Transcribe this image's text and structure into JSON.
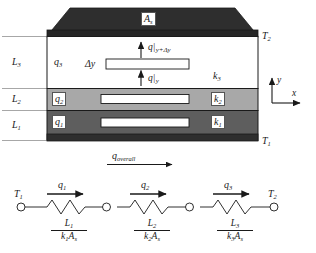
{
  "figure": {
    "colors": {
      "layer1": "#5e5e5e",
      "layer2": "#a8a8a8",
      "layer3": "#ffffff",
      "top_slab": "#2e2e2e",
      "bottom_strip": "#2e2e2e",
      "outline": "#1a1a1a",
      "dimension_line": "#808080"
    }
  },
  "slab": {
    "area_label": "A",
    "area_sub": "s",
    "top_temperature": "T",
    "top_temperature_sub": "2",
    "bottom_temperature": "T",
    "bottom_temperature_sub": "1"
  },
  "layers": [
    {
      "thickness_label": "L",
      "thickness_sub": "3",
      "heat_label": "q",
      "heat_sub": "3",
      "conductivity_label": "k",
      "conductivity_sub": "3",
      "fill": "#ffffff"
    },
    {
      "thickness_label": "L",
      "thickness_sub": "2",
      "heat_label": "q",
      "heat_sub": "2",
      "conductivity_label": "k",
      "conductivity_sub": "2",
      "fill": "#a8a8a8"
    },
    {
      "thickness_label": "L",
      "thickness_sub": "1",
      "heat_label": "q",
      "heat_sub": "1",
      "conductivity_label": "k",
      "conductivity_sub": "1",
      "fill": "#5e5e5e"
    }
  ],
  "control_volume": {
    "delta_y_label": "Δy",
    "flux_in_base": "q",
    "flux_in_sub": "y",
    "flux_out_base": "q",
    "flux_out_sub": "y+Δy"
  },
  "overall": {
    "label": "q",
    "subscript": "overall"
  },
  "axes": {
    "x_label": "x",
    "y_label": "y"
  },
  "network": {
    "left_node_label": "T",
    "left_node_sub": "1",
    "right_node_label": "T",
    "right_node_sub": "2",
    "resistors": [
      {
        "flow_label": "q",
        "flow_sub": "1",
        "numerator": "L",
        "numerator_sub": "1",
        "denominator_k": "k",
        "denominator_k_sub": "1",
        "denominator_a": "A",
        "denominator_a_sub": "s"
      },
      {
        "flow_label": "q",
        "flow_sub": "2",
        "numerator": "L",
        "numerator_sub": "2",
        "denominator_k": "k",
        "denominator_k_sub": "2",
        "denominator_a": "A",
        "denominator_a_sub": "s"
      },
      {
        "flow_label": "q",
        "flow_sub": "3",
        "numerator": "L",
        "numerator_sub": "3",
        "denominator_k": "k",
        "denominator_k_sub": "3",
        "denominator_a": "A",
        "denominator_a_sub": "s"
      }
    ]
  }
}
